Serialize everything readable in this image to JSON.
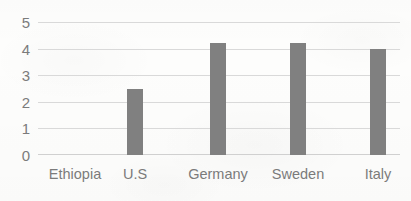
{
  "chart_data": {
    "type": "bar",
    "title": "",
    "subtitle": "",
    "xlabel": "",
    "ylabel": "",
    "categories": [
      "Ethiopia",
      "U.S",
      "Germany",
      "Sweden",
      "Italy"
    ],
    "values": [
      0,
      2.5,
      4.2,
      4.2,
      4.0
    ],
    "ylim": [
      0,
      5
    ],
    "ytick_labels": [
      "5",
      "4",
      "3",
      "2",
      "1",
      "0"
    ],
    "ytick_values": [
      5,
      4,
      3,
      2,
      1,
      0
    ],
    "grid": true,
    "legend": false,
    "legend_position": "none",
    "annotations": [],
    "series": [
      {
        "name": "",
        "values": [
          0,
          2.5,
          4.2,
          4.2,
          4.0
        ]
      }
    ]
  },
  "style": {
    "bar_color": "#808080",
    "gridline_color": "#d9d9d9",
    "axis_line_color": "#d0d0d0",
    "label_color": "#7b7b7b",
    "background_color": "#fdfdfc"
  }
}
